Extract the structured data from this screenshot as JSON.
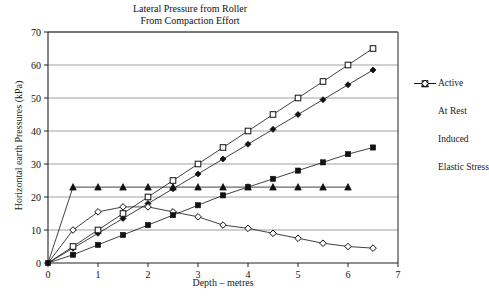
{
  "chart_data": {
    "type": "line",
    "title": "Lateral Pressure from Roller",
    "subtitle": "From Compaction Effort",
    "xlabel": "Depth – metres",
    "ylabel": "Horizontal earth Pressures  (kPa)",
    "xlim": [
      0,
      7
    ],
    "ylim": [
      0,
      70
    ],
    "xticks": [
      0,
      1,
      2,
      3,
      4,
      5,
      6,
      7
    ],
    "yticks": [
      0,
      10,
      20,
      30,
      40,
      50,
      60,
      70
    ],
    "grid": "horizontal",
    "legend_position": "right",
    "series": [
      {
        "name": "Active",
        "marker": "filled-diamond",
        "x": [
          0,
          0.5,
          1,
          1.5,
          2,
          2.5,
          3,
          3.5,
          4,
          4.5,
          5,
          5.5,
          6,
          6.5
        ],
        "y": [
          0,
          4.5,
          9,
          13.5,
          18,
          22.5,
          27,
          31.5,
          36,
          40.5,
          45,
          49.5,
          54,
          58.5
        ]
      },
      {
        "name": "At Rest",
        "marker": "filled-triangle",
        "x": [
          0,
          0.5,
          1,
          1.5,
          2,
          2.5,
          3,
          3.5,
          4,
          4.5,
          5,
          5.5,
          6
        ],
        "y": [
          0,
          23,
          23,
          23,
          23,
          23,
          23,
          23,
          23,
          23,
          23,
          23,
          23
        ]
      },
      {
        "name": "Induced",
        "marker": "open-square",
        "x": [
          0,
          0.5,
          1,
          1.5,
          2,
          2.5,
          3,
          3.5,
          4,
          4.5,
          5,
          5.5,
          6,
          6.5
        ],
        "y": [
          0,
          5,
          10,
          15,
          20,
          25,
          30,
          35,
          40,
          45,
          50,
          55,
          60,
          65
        ]
      },
      {
        "name": "Elastic Stress",
        "marker": "open-diamond",
        "x": [
          0,
          0.5,
          1,
          1.5,
          2,
          2.5,
          3,
          3.5,
          4,
          4.5,
          5,
          5.5,
          6,
          6.5
        ],
        "y": [
          0,
          10,
          15.5,
          17,
          17,
          15.5,
          14,
          11.5,
          10.5,
          9,
          7.5,
          6,
          5,
          4.5
        ]
      },
      {
        "name": "Compaction",
        "marker": "filled-square",
        "x": [
          0,
          0.5,
          1,
          1.5,
          2,
          2.5,
          3,
          3.5,
          4,
          4.5,
          5,
          5.5,
          6,
          6.5
        ],
        "y": [
          0,
          2.5,
          5.5,
          8.5,
          11.5,
          14.5,
          17.5,
          20.5,
          23,
          25.5,
          28,
          30.5,
          33,
          35
        ]
      }
    ],
    "legend": [
      {
        "label": "Active",
        "marker": "filled-diamond"
      },
      {
        "label": "At Rest",
        "marker": "filled-triangle"
      },
      {
        "label": "Induced",
        "marker": "open-square"
      },
      {
        "label": "Elastic Stress",
        "marker": "open-diamond"
      }
    ],
    "colors": {
      "axis": "#222222",
      "grid": "#888888",
      "series": "#111111",
      "background": "#ffffff"
    }
  }
}
